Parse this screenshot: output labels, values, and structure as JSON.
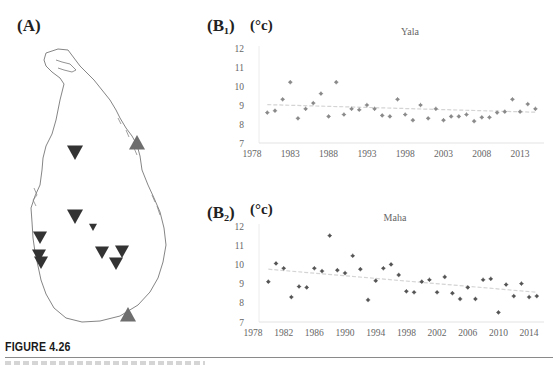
{
  "figure": {
    "title": "FIGURE 4.26",
    "panel_a_label": "(A)",
    "panel_b1_label": "(B₁)",
    "panel_b2_label": "(B₂)",
    "unit_label": "(°c)"
  },
  "map": {
    "region": "Sri Lanka",
    "markers": [
      {
        "type": "down-triangle",
        "x": 75,
        "y": 152,
        "size": 8,
        "color": "#333333"
      },
      {
        "type": "down-triangle",
        "x": 75,
        "y": 216,
        "size": 8,
        "color": "#333333"
      },
      {
        "type": "down-triangle",
        "x": 93,
        "y": 227,
        "size": 4,
        "color": "#333333"
      },
      {
        "type": "down-triangle",
        "x": 40,
        "y": 237,
        "size": 7,
        "color": "#333333"
      },
      {
        "type": "down-triangle",
        "x": 39,
        "y": 255,
        "size": 7,
        "color": "#333333"
      },
      {
        "type": "down-triangle",
        "x": 41,
        "y": 262,
        "size": 7,
        "color": "#333333"
      },
      {
        "type": "down-triangle",
        "x": 102,
        "y": 252,
        "size": 7,
        "color": "#333333"
      },
      {
        "type": "down-triangle",
        "x": 122,
        "y": 251,
        "size": 7,
        "color": "#333333"
      },
      {
        "type": "down-triangle",
        "x": 116,
        "y": 263,
        "size": 7,
        "color": "#333333"
      },
      {
        "type": "up-triangle",
        "x": 137,
        "y": 143,
        "size": 8,
        "color": "#6e6e6e"
      },
      {
        "type": "up-triangle",
        "x": 128,
        "y": 315,
        "size": 8,
        "color": "#6e6e6e"
      }
    ]
  },
  "chart_data": [
    {
      "id": "B1",
      "type": "scatter",
      "title": "Yala",
      "xlabel": "",
      "ylabel": "(°c)",
      "ylim": [
        7,
        12
      ],
      "xlim": [
        1978,
        2015
      ],
      "yticks": [
        7,
        8,
        9,
        10,
        11,
        12
      ],
      "xticks": [
        1978,
        1983,
        1988,
        1993,
        1998,
        2003,
        2008,
        2013
      ],
      "grid": false,
      "legend": "none",
      "marker_color": "#8a8a8a",
      "trend_line": {
        "x": [
          1980,
          2015
        ],
        "y": [
          9.02,
          8.62
        ],
        "color": "#d4d4d4"
      },
      "x": [
        1980,
        1981,
        1982,
        1983,
        1984,
        1985,
        1986,
        1987,
        1988,
        1989,
        1990,
        1991,
        1992,
        1993,
        1994,
        1995,
        1996,
        1997,
        1998,
        1999,
        2000,
        2001,
        2002,
        2003,
        2004,
        2005,
        2006,
        2007,
        2008,
        2009,
        2010,
        2011,
        2012,
        2013,
        2014,
        2015
      ],
      "values": [
        8.6,
        8.7,
        9.3,
        10.2,
        8.3,
        8.8,
        9.1,
        9.6,
        8.4,
        10.2,
        8.5,
        8.8,
        8.75,
        9.0,
        8.8,
        8.45,
        8.4,
        9.3,
        8.5,
        8.2,
        9.0,
        8.3,
        8.8,
        8.2,
        8.4,
        8.4,
        8.5,
        8.15,
        8.35,
        8.35,
        8.6,
        8.65,
        9.3,
        8.65,
        9.05,
        8.8
      ]
    },
    {
      "id": "B2",
      "type": "scatter",
      "title": "Maha",
      "xlabel": "",
      "ylabel": "(°c)",
      "ylim": [
        7,
        12
      ],
      "xlim": [
        1978,
        2015
      ],
      "yticks": [
        7,
        8,
        9,
        10,
        11,
        12
      ],
      "xticks": [
        1978,
        1982,
        1986,
        1990,
        1994,
        1998,
        2002,
        2006,
        2010,
        2014
      ],
      "grid": false,
      "legend": "none",
      "marker_color": "#555555",
      "trend_line": {
        "x": [
          1980,
          2015
        ],
        "y": [
          9.75,
          8.55
        ],
        "color": "#d4d4d4"
      },
      "x": [
        1980,
        1981,
        1982,
        1983,
        1984,
        1985,
        1986,
        1987,
        1988,
        1989,
        1990,
        1991,
        1992,
        1993,
        1994,
        1995,
        1996,
        1997,
        1998,
        1999,
        2000,
        2001,
        2002,
        2003,
        2004,
        2005,
        2006,
        2007,
        2008,
        2009,
        2010,
        2011,
        2012,
        2013,
        2014,
        2015
      ],
      "values": [
        9.1,
        10.05,
        9.8,
        8.3,
        8.85,
        8.8,
        9.8,
        9.65,
        11.5,
        9.7,
        9.55,
        10.45,
        9.75,
        8.15,
        9.15,
        9.8,
        10.0,
        9.45,
        8.6,
        8.55,
        9.1,
        9.2,
        8.55,
        9.35,
        8.5,
        8.2,
        8.8,
        8.2,
        9.2,
        9.25,
        7.5,
        8.95,
        8.35,
        9.0,
        8.3,
        8.35
      ]
    }
  ]
}
